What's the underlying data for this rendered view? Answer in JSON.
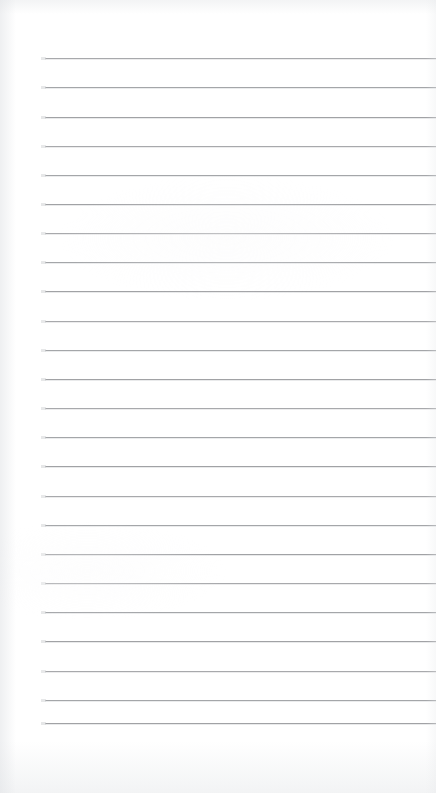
{
  "document": {
    "kind": "lined-note-page",
    "title": "Lined Note Page",
    "width": 436,
    "height": 793,
    "content_text": "",
    "is_blank": true
  },
  "paper": {
    "background_color": "#ffffff",
    "edge_shadow_color": "#e4e6e9"
  },
  "ruling": {
    "line_color": "#9a9c9f",
    "line_thickness_px": 1,
    "line_count": 24,
    "first_line_y": 58,
    "line_spacing_px": 29.2,
    "left_margin_x": 45,
    "right_edge_x": 436,
    "lines_y": [
      58,
      87,
      117,
      146,
      175,
      204,
      233,
      262,
      291,
      321,
      350,
      379,
      408,
      437,
      466,
      496,
      525,
      554,
      583,
      612,
      641,
      671,
      700,
      723
    ]
  }
}
